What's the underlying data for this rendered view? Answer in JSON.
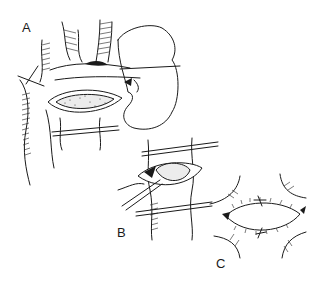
{
  "figure": {
    "type": "surgical line illustration",
    "panels": [
      {
        "id": "A",
        "label": "A",
        "description": "vessel exposed with longitudinal arteriotomy, plaque visible, kidney outline at right, vessel loops placed"
      },
      {
        "id": "B",
        "label": "B",
        "description": "endarterectomy: plaque being elevated with instrument from opened vessel"
      },
      {
        "id": "C",
        "label": "C",
        "description": "closure of arteriotomy with running suture"
      }
    ],
    "colors": {
      "ink": "#1a1a1a",
      "background": "#ffffff",
      "plaque_fill": "#ececec"
    }
  }
}
